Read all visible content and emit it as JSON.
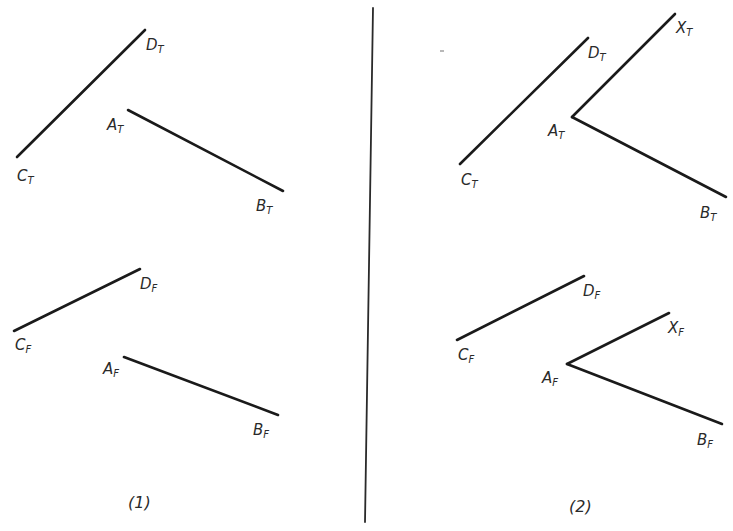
{
  "figure": {
    "type": "descriptive-geometry orthographic projections",
    "panels": [
      {
        "caption": "(1)",
        "top_view": {
          "lines": [
            {
              "from": "C",
              "to": "D",
              "label_from": {
                "main": "C",
                "sub": "T"
              },
              "label_to": {
                "main": "D",
                "sub": "T"
              }
            },
            {
              "from": "A",
              "to": "B",
              "label_from": {
                "main": "A",
                "sub": "T"
              },
              "label_to": {
                "main": "B",
                "sub": "T"
              }
            }
          ]
        },
        "front_view": {
          "lines": [
            {
              "from": "C",
              "to": "D",
              "label_from": {
                "main": "C",
                "sub": "F"
              },
              "label_to": {
                "main": "D",
                "sub": "F"
              }
            },
            {
              "from": "A",
              "to": "B",
              "label_from": {
                "main": "A",
                "sub": "F"
              },
              "label_to": {
                "main": "B",
                "sub": "F"
              }
            }
          ]
        }
      },
      {
        "caption": "(2)",
        "top_view": {
          "lines": [
            {
              "from": "C",
              "to": "D",
              "label_from": {
                "main": "C",
                "sub": "T"
              },
              "label_to": {
                "main": "D",
                "sub": "T"
              }
            },
            {
              "from": "A",
              "to": "B",
              "label_from": {
                "main": "A",
                "sub": "T"
              },
              "label_to": {
                "main": "B",
                "sub": "T"
              }
            },
            {
              "from": "A",
              "to": "X",
              "label_to": {
                "main": "X",
                "sub": "T"
              }
            }
          ]
        },
        "front_view": {
          "lines": [
            {
              "from": "C",
              "to": "D",
              "label_from": {
                "main": "C",
                "sub": "F"
              },
              "label_to": {
                "main": "D",
                "sub": "F"
              }
            },
            {
              "from": "A",
              "to": "B",
              "label_from": {
                "main": "A",
                "sub": "F"
              },
              "label_to": {
                "main": "B",
                "sub": "F"
              }
            },
            {
              "from": "A",
              "to": "X",
              "label_to": {
                "main": "X",
                "sub": "F"
              }
            }
          ]
        }
      }
    ]
  },
  "labels": {
    "p1": {
      "ct": {
        "main": "C",
        "sub": "T"
      },
      "dt": {
        "main": "D",
        "sub": "T"
      },
      "at": {
        "main": "A",
        "sub": "T"
      },
      "bt": {
        "main": "B",
        "sub": "T"
      },
      "cf": {
        "main": "C",
        "sub": "F"
      },
      "df": {
        "main": "D",
        "sub": "F"
      },
      "af": {
        "main": "A",
        "sub": "F"
      },
      "bf": {
        "main": "B",
        "sub": "F"
      },
      "caption": "(1)"
    },
    "p2": {
      "ct": {
        "main": "C",
        "sub": "T"
      },
      "dt": {
        "main": "D",
        "sub": "T"
      },
      "at": {
        "main": "A",
        "sub": "T"
      },
      "bt": {
        "main": "B",
        "sub": "T"
      },
      "xt": {
        "main": "X",
        "sub": "T"
      },
      "cf": {
        "main": "C",
        "sub": "F"
      },
      "df": {
        "main": "D",
        "sub": "F"
      },
      "af": {
        "main": "A",
        "sub": "F"
      },
      "bf": {
        "main": "B",
        "sub": "F"
      },
      "xf": {
        "main": "X",
        "sub": "F"
      },
      "caption": "(2)"
    }
  },
  "colors": {
    "background": "#ffffff",
    "ink": "#1a1a1a"
  }
}
